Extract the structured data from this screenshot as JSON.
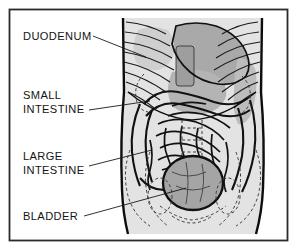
{
  "figure": {
    "frame_color": "#2b2b2b",
    "background_color": "#ffffff",
    "ink_color": "#141414",
    "organ_shade_color": "#a8a8a8",
    "body_shade_color": "#dcdcdc"
  },
  "labels": [
    {
      "id": "duodenum",
      "line1": "DUODENUM",
      "line2": ""
    },
    {
      "id": "small-intestine",
      "line1": "SMALL",
      "line2": "INTESTINE"
    },
    {
      "id": "large-intestine",
      "line1": "LARGE",
      "line2": "INTESTINE"
    },
    {
      "id": "bladder",
      "line1": "BLADDER",
      "line2": ""
    }
  ]
}
